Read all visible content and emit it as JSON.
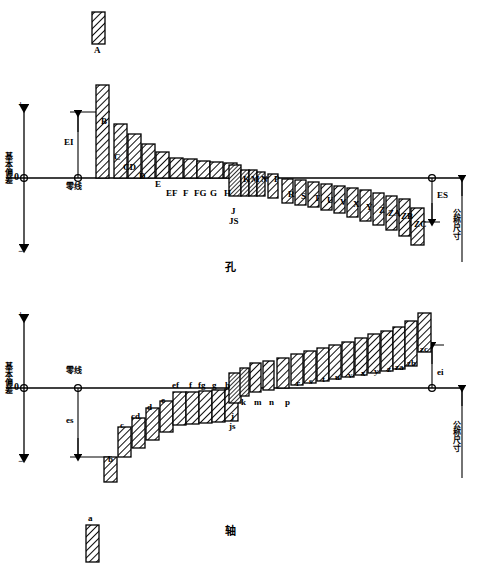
{
  "figure": {
    "title_hole": "孔",
    "title_shaft": "轴",
    "axis_label": "基本偏差",
    "zero_line_label": "零线",
    "nominal_size_label": "公称尺寸",
    "plus_sign": "+",
    "minus_sign": "−",
    "zero_tick": "0",
    "deviation_ei": "EI",
    "deviation_es": "ES",
    "deviation_es_lower": "es",
    "deviation_ei_lower": "ei"
  },
  "chart_data": {
    "type": "bar",
    "xlabel": "公称尺寸",
    "ylabel": "基本偏差",
    "grid": false,
    "legend": "none",
    "charts": [
      {
        "name": "hole",
        "title": "孔",
        "note": "Hole fundamental deviations; A..H above zero line, J..ZC below",
        "detached": {
          "label": "A",
          "x": 92,
          "top": 12,
          "bottom": 44,
          "width": 13
        },
        "categories": [
          "B",
          "C",
          "CD",
          "D",
          "E",
          "EF",
          "F",
          "FG",
          "G",
          "H",
          "J",
          "JS",
          "K",
          "M",
          "N",
          "P",
          "R",
          "S",
          "T",
          "U",
          "V",
          "X",
          "Y",
          "Z",
          "ZA",
          "ZB",
          "ZC"
        ],
        "bars": [
          {
            "label": "B",
            "x": 96,
            "top": 85,
            "bottom": 178,
            "width": 13,
            "label_x": 101,
            "label_y": 117,
            "label_pos": "below-right"
          },
          {
            "label": "C",
            "x": 114,
            "top": 124,
            "bottom": 178,
            "width": 13,
            "label_x": 114,
            "label_y": 153
          },
          {
            "label": "CD",
            "x": 128,
            "top": 134,
            "bottom": 178,
            "width": 13,
            "label_x": 123,
            "label_y": 163
          },
          {
            "label": "D",
            "x": 142,
            "top": 144,
            "bottom": 178,
            "width": 13,
            "label_x": 139,
            "label_y": 172
          },
          {
            "label": "E",
            "x": 156,
            "top": 152,
            "bottom": 178,
            "width": 13,
            "label_x": 155,
            "label_y": 180
          },
          {
            "label": "EF",
            "x": 170,
            "top": 158,
            "bottom": 178,
            "width": 13,
            "label_x": 166,
            "label_y": 189
          },
          {
            "label": "F",
            "x": 184,
            "top": 159,
            "bottom": 178,
            "width": 13,
            "label_x": 183,
            "label_y": 189
          },
          {
            "label": "FG",
            "x": 197,
            "top": 161,
            "bottom": 178,
            "width": 13,
            "label_x": 194,
            "label_y": 189
          },
          {
            "label": "G",
            "x": 210,
            "top": 162,
            "bottom": 178,
            "width": 13,
            "label_x": 210,
            "label_y": 189
          },
          {
            "label": "H",
            "x": 224,
            "top": 163,
            "bottom": 178,
            "width": 13,
            "label_x": 224,
            "label_y": 189
          },
          {
            "label": "J",
            "x": 229,
            "top": 165,
            "bottom": 196,
            "width": 12,
            "label_x": 231,
            "label_y": 207
          },
          {
            "label": "JS",
            "x": 229,
            "top": 165,
            "bottom": 196,
            "width": 12,
            "label_x": 229,
            "label_y": 217
          },
          {
            "label": "K",
            "x": 241,
            "top": 170,
            "bottom": 196,
            "width": 8,
            "label_x": 243,
            "label_y": 175,
            "label_pos": "above"
          },
          {
            "label": "M",
            "x": 249,
            "top": 170,
            "bottom": 196,
            "width": 8,
            "label_x": 251,
            "label_y": 175,
            "label_pos": "above"
          },
          {
            "label": "N",
            "x": 257,
            "top": 172,
            "bottom": 196,
            "width": 8,
            "label_x": 261,
            "label_y": 175,
            "label_pos": "above"
          },
          {
            "label": "P",
            "x": 268,
            "top": 174,
            "bottom": 198,
            "width": 10,
            "label_x": 274,
            "label_y": 175,
            "label_pos": "above"
          },
          {
            "label": "R",
            "x": 282,
            "top": 179,
            "bottom": 203,
            "width": 11,
            "label_x": 288,
            "label_y": 190
          },
          {
            "label": "S",
            "x": 295,
            "top": 180,
            "bottom": 205,
            "width": 11,
            "label_x": 301,
            "label_y": 192
          },
          {
            "label": "T",
            "x": 308,
            "top": 182,
            "bottom": 207,
            "width": 11,
            "label_x": 314,
            "label_y": 194
          },
          {
            "label": "U",
            "x": 321,
            "top": 184,
            "bottom": 210,
            "width": 11,
            "label_x": 327,
            "label_y": 196
          },
          {
            "label": "V",
            "x": 334,
            "top": 186,
            "bottom": 213,
            "width": 11,
            "label_x": 340,
            "label_y": 198
          },
          {
            "label": "X",
            "x": 347,
            "top": 188,
            "bottom": 217,
            "width": 11,
            "label_x": 353,
            "label_y": 200
          },
          {
            "label": "Y",
            "x": 360,
            "top": 190,
            "bottom": 221,
            "width": 11,
            "label_x": 366,
            "label_y": 203
          },
          {
            "label": "Z",
            "x": 373,
            "top": 193,
            "bottom": 225,
            "width": 11,
            "label_x": 379,
            "label_y": 206
          },
          {
            "label": "ZA",
            "x": 386,
            "top": 196,
            "bottom": 230,
            "width": 11,
            "label_x": 388,
            "label_y": 209
          },
          {
            "label": "ZB",
            "x": 399,
            "top": 199,
            "bottom": 236,
            "width": 11,
            "label_x": 401,
            "label_y": 212
          },
          {
            "label": "ZC",
            "x": 411,
            "top": 208,
            "bottom": 245,
            "width": 13,
            "label_x": 414,
            "label_y": 220
          }
        ]
      },
      {
        "name": "shaft",
        "title": "轴",
        "note": "Shaft fundamental deviations; a..h below zero line, j..zc above",
        "detached": {
          "label": "a",
          "x": 86,
          "top": 525,
          "bottom": 562,
          "width": 13
        },
        "categories": [
          "b",
          "c",
          "cd",
          "d",
          "e",
          "ef",
          "f",
          "fg",
          "g",
          "h",
          "j",
          "js",
          "k",
          "m",
          "n",
          "p",
          "r",
          "s",
          "t",
          "u",
          "v",
          "x",
          "y",
          "z",
          "za",
          "zb",
          "zc"
        ],
        "bars": [
          {
            "label": "b",
            "x": 104,
            "top": 457,
            "bottom": 482,
            "width": 13,
            "label_x": 108,
            "label_y": 455,
            "label_pos": "above"
          },
          {
            "label": "c",
            "x": 118,
            "top": 427,
            "bottom": 457,
            "width": 13,
            "label_x": 120,
            "label_y": 421,
            "label_pos": "above"
          },
          {
            "label": "cd",
            "x": 132,
            "top": 418,
            "bottom": 448,
            "width": 13,
            "label_x": 131,
            "label_y": 412,
            "label_pos": "above"
          },
          {
            "label": "d",
            "x": 146,
            "top": 408,
            "bottom": 440,
            "width": 13,
            "label_x": 147,
            "label_y": 403,
            "label_pos": "above"
          },
          {
            "label": "e",
            "x": 160,
            "top": 401,
            "bottom": 432,
            "width": 13,
            "label_x": 161,
            "label_y": 396,
            "label_pos": "above"
          },
          {
            "label": "ef",
            "x": 173,
            "top": 392,
            "bottom": 425,
            "width": 13,
            "label_x": 172,
            "label_y": 381,
            "label_pos": "above-line"
          },
          {
            "label": "f",
            "x": 186,
            "top": 392,
            "bottom": 424,
            "width": 13,
            "label_x": 189,
            "label_y": 381,
            "label_pos": "above-line"
          },
          {
            "label": "fg",
            "x": 199,
            "top": 391,
            "bottom": 423,
            "width": 13,
            "label_x": 198,
            "label_y": 381,
            "label_pos": "above-line"
          },
          {
            "label": "g",
            "x": 212,
            "top": 390,
            "bottom": 422,
            "width": 13,
            "label_x": 212,
            "label_y": 381,
            "label_pos": "above-line"
          },
          {
            "label": "h",
            "x": 225,
            "top": 389,
            "bottom": 421,
            "width": 13,
            "label_x": 225,
            "label_y": 381,
            "label_pos": "above-line"
          },
          {
            "label": "j",
            "x": 229,
            "top": 373,
            "bottom": 403,
            "width": 12,
            "label_x": 231,
            "label_y": 412
          },
          {
            "label": "js",
            "x": 229,
            "top": 373,
            "bottom": 403,
            "width": 12,
            "label_x": 229,
            "label_y": 422
          },
          {
            "label": "k",
            "x": 240,
            "top": 368,
            "bottom": 396,
            "width": 9,
            "label_x": 241,
            "label_y": 398,
            "label_pos": "below"
          },
          {
            "label": "m",
            "x": 250,
            "top": 363,
            "bottom": 392,
            "width": 11,
            "label_x": 254,
            "label_y": 398,
            "label_pos": "below"
          },
          {
            "label": "n",
            "x": 263,
            "top": 361,
            "bottom": 390,
            "width": 11,
            "label_x": 269,
            "label_y": 398,
            "label_pos": "below"
          },
          {
            "label": "p",
            "x": 277,
            "top": 358,
            "bottom": 388,
            "width": 12,
            "label_x": 285,
            "label_y": 398,
            "label_pos": "below"
          },
          {
            "label": "r",
            "x": 291,
            "top": 354,
            "bottom": 385,
            "width": 12,
            "label_x": 296,
            "label_y": 379
          },
          {
            "label": "s",
            "x": 304,
            "top": 351,
            "bottom": 383,
            "width": 12,
            "label_x": 309,
            "label_y": 377
          },
          {
            "label": "t",
            "x": 317,
            "top": 348,
            "bottom": 381,
            "width": 12,
            "label_x": 322,
            "label_y": 375
          },
          {
            "label": "u",
            "x": 329,
            "top": 345,
            "bottom": 379,
            "width": 12,
            "label_x": 335,
            "label_y": 373
          },
          {
            "label": "v",
            "x": 342,
            "top": 342,
            "bottom": 377,
            "width": 12,
            "label_x": 348,
            "label_y": 371
          },
          {
            "label": "x",
            "x": 355,
            "top": 338,
            "bottom": 375,
            "width": 12,
            "label_x": 361,
            "label_y": 369
          },
          {
            "label": "y",
            "x": 368,
            "top": 334,
            "bottom": 373,
            "width": 12,
            "label_x": 374,
            "label_y": 367
          },
          {
            "label": "z",
            "x": 381,
            "top": 331,
            "bottom": 371,
            "width": 12,
            "label_x": 387,
            "label_y": 365
          },
          {
            "label": "za",
            "x": 393,
            "top": 327,
            "bottom": 369,
            "width": 12,
            "label_x": 395,
            "label_y": 363
          },
          {
            "label": "zb",
            "x": 405,
            "top": 321,
            "bottom": 366,
            "width": 12,
            "label_x": 407,
            "label_y": 359
          },
          {
            "label": "zc",
            "x": 418,
            "top": 313,
            "bottom": 352,
            "width": 13,
            "label_x": 420,
            "label_y": 345
          }
        ]
      }
    ]
  }
}
